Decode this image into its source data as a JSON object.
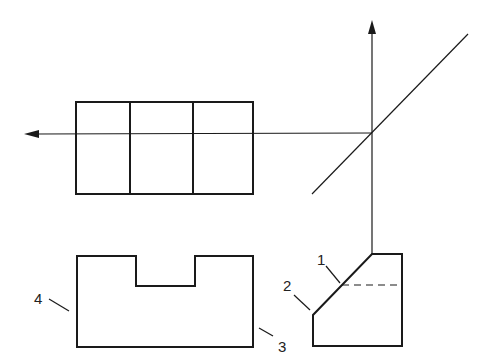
{
  "diagram": {
    "labels": [
      {
        "id": "1",
        "text": "1",
        "x": 317,
        "y": 265
      },
      {
        "id": "2",
        "text": "2",
        "x": 283,
        "y": 291
      },
      {
        "id": "3",
        "text": "3",
        "x": 278,
        "y": 352
      },
      {
        "id": "4",
        "text": "4",
        "x": 34,
        "y": 304
      }
    ],
    "colors": {
      "stroke": "#1a1a1a"
    }
  }
}
